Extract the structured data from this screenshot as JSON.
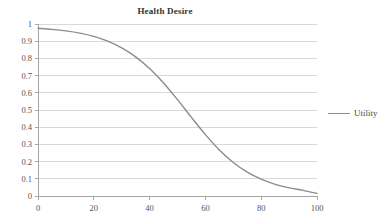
{
  "chart_data": {
    "type": "line",
    "title": "Health Desire",
    "xlabel": "",
    "ylabel": "",
    "xlim": [
      0,
      100
    ],
    "ylim": [
      0,
      1
    ],
    "grid": true,
    "grid_axis": "y",
    "legend_position": "right",
    "line_color": "#8c8c8c",
    "gridline_color": "#d9d9d9",
    "axis_color": "#a6a6a6",
    "xticks": [
      0,
      20,
      40,
      60,
      80,
      100
    ],
    "xtick_labels": [
      "0",
      "20",
      "40",
      "60",
      "80",
      "100"
    ],
    "yticks": [
      0,
      0.1,
      0.2,
      0.3,
      0.4,
      0.5,
      0.6,
      0.7,
      0.8,
      0.9,
      1
    ],
    "ytick_labels": [
      "0",
      "0.1",
      "0.2",
      "0.3",
      "0.4",
      "0.5",
      "0.6",
      "0.7",
      "0.8",
      "0.9",
      "1"
    ],
    "series": [
      {
        "name": "Utility",
        "color": "#8c8c8c",
        "x": [
          0,
          5,
          10,
          15,
          20,
          25,
          30,
          35,
          40,
          45,
          50,
          55,
          60,
          65,
          70,
          75,
          80,
          85,
          90,
          95,
          100
        ],
        "values": [
          0.975,
          0.969,
          0.96,
          0.947,
          0.928,
          0.9,
          0.861,
          0.809,
          0.741,
          0.657,
          0.56,
          0.457,
          0.357,
          0.268,
          0.195,
          0.139,
          0.098,
          0.068,
          0.047,
          0.033,
          0.015
        ]
      }
    ],
    "legend": [
      {
        "label": "Utility",
        "color": "#8c8c8c"
      }
    ]
  },
  "plot": {
    "left": 38,
    "right": 317,
    "top": 24,
    "bottom": 196
  }
}
